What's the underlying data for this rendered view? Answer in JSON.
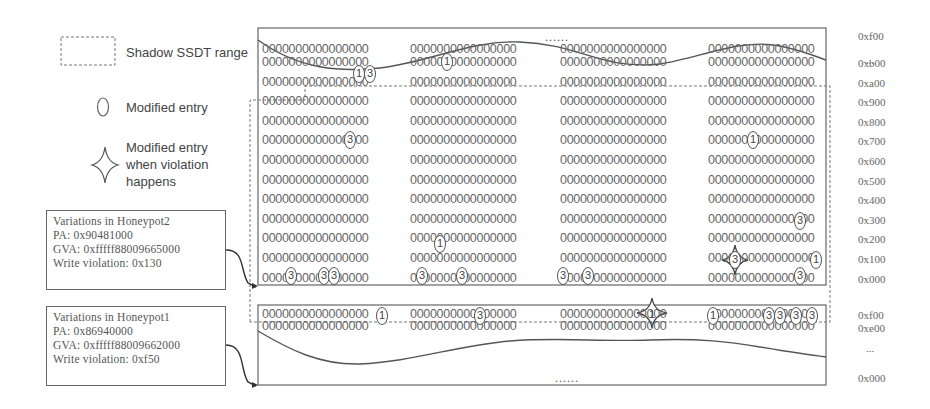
{
  "legend": {
    "shadow_range_label": "Shadow SSDT range",
    "modified_entry_label": "Modified entry",
    "violation_label_lines": [
      "Modified entry",
      "when violation",
      "happens"
    ]
  },
  "honeypots": [
    {
      "title": "Variations in Honeypot2",
      "pa": "PA:   0x90481000",
      "gva": "GVA: 0xfffff88009665000",
      "violation": "Write violation: 0x130"
    },
    {
      "title": "Variations in Honeypot1",
      "pa": "PA:   0x86940000",
      "gva": "GVA: 0xfffff88009662000",
      "violation": "Write violation: 0xf50"
    }
  ],
  "upper_block": {
    "ellipsis": "......",
    "top_address": "0xf00",
    "dots": "...",
    "row_value": "0000000000000000",
    "row_addresses": [
      "0xb00",
      "0xa00",
      "0x900",
      "0x800",
      "0x700",
      "0x600",
      "0x500",
      "0x400",
      "0x300",
      "0x200",
      "0x100",
      "0x000"
    ],
    "modified_marks": [
      {
        "row": "0xb00",
        "col": 2,
        "label": "1"
      },
      {
        "row": "0xa00",
        "col": 1,
        "label": "1"
      },
      {
        "row": "0xa00",
        "col": 1,
        "label": "3"
      },
      {
        "row": "0x800",
        "col": 1,
        "label": "3"
      },
      {
        "row": "0x800",
        "col": 4,
        "label": "1"
      },
      {
        "row": "0x300",
        "col": 4,
        "label": "3"
      },
      {
        "row": "0x200",
        "col": 2,
        "label": "1"
      },
      {
        "row": "0x100",
        "col": 4,
        "label": "3",
        "violation": true
      },
      {
        "row": "0x100",
        "col": 4,
        "label": "1"
      },
      {
        "row": "0x000",
        "col": 1,
        "label": "3"
      },
      {
        "row": "0x000",
        "col": 1,
        "label": "3"
      },
      {
        "row": "0x000",
        "col": 1,
        "label": "3"
      },
      {
        "row": "0x000",
        "col": 2,
        "label": "3"
      },
      {
        "row": "0x000",
        "col": 2,
        "label": "3"
      },
      {
        "row": "0x000",
        "col": 3,
        "label": "3"
      },
      {
        "row": "0x000",
        "col": 3,
        "label": "3"
      },
      {
        "row": "0x000",
        "col": 4,
        "label": "3"
      }
    ]
  },
  "lower_block": {
    "ellipsis": "......",
    "row_addresses": [
      "0xf00",
      "0xe00"
    ],
    "dots": "...",
    "bottom_address": "0x000",
    "row_value": "0000000000000000",
    "modified_marks": [
      {
        "row": "0xf00",
        "col": 1,
        "label": "1"
      },
      {
        "row": "0xf00",
        "col": 2,
        "label": "3"
      },
      {
        "row": "0xf00",
        "col": 3,
        "label": "1",
        "violation": true
      },
      {
        "row": "0xf00",
        "col": 4,
        "label": "1"
      },
      {
        "row": "0xf00",
        "col": 4,
        "label": "3"
      },
      {
        "row": "0xf00",
        "col": 4,
        "label": "3"
      },
      {
        "row": "0xf00",
        "col": 4,
        "label": "3"
      },
      {
        "row": "0xf00",
        "col": 4,
        "label": "3"
      }
    ]
  },
  "marks": {
    "u_b00_c2": "1",
    "u_a00_c1a": "1",
    "u_a00_c1b": "3",
    "u_800_c1": "3",
    "u_800_c4": "1",
    "u_300_c4": "3",
    "u_200_c2": "1",
    "u_100_c4a": "3",
    "u_100_c4b": "1",
    "u_000_c1a": "3",
    "u_000_c1b": "3",
    "u_000_c1c": "3",
    "u_000_c2a": "3",
    "u_000_c2b": "3",
    "u_000_c3a": "3",
    "u_000_c3b": "3",
    "u_000_c4": "3",
    "l_f00_c1": "1",
    "l_f00_c2": "3",
    "l_f00_c3": "1",
    "l_f00_c4a": "1",
    "l_f00_c4b": "3",
    "l_f00_c4c": "3",
    "l_f00_c4d": "3",
    "l_f00_c4e": "3"
  },
  "colors": {
    "line": "#555555",
    "dashed": "#777777",
    "text": "#666666"
  }
}
